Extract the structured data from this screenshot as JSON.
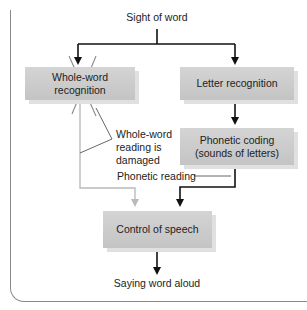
{
  "diagram": {
    "top_cut_text": "p                g",
    "source": "Sight of word",
    "boxes": {
      "whole_word": "Whole-word recognition",
      "letter": "Letter recognition",
      "phonetic": "Phonetic coding (sounds of letters)",
      "speech": "Control of speech"
    },
    "annotations": {
      "damaged": "Whole-word reading is damaged",
      "damaged_lines": [
        "Whole-word",
        "reading is",
        "damaged"
      ],
      "phonetic_reading": "Phonetic reading"
    },
    "output": "Saying word aloud",
    "colors": {
      "box": "#c8c8c8",
      "arrow_active": "#111111",
      "arrow_disabled": "#bdbdbd",
      "cross": "#888888"
    }
  }
}
